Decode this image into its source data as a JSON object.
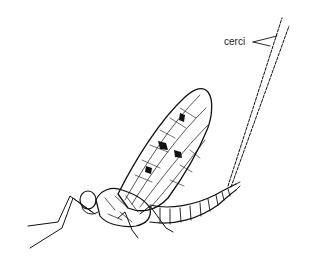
{
  "figure": {
    "labels": [
      {
        "id": "cerci",
        "text": "cerci",
        "points_to": "cerci"
      }
    ],
    "colors": {
      "ink": "#111111",
      "background": "#ffffff"
    }
  }
}
